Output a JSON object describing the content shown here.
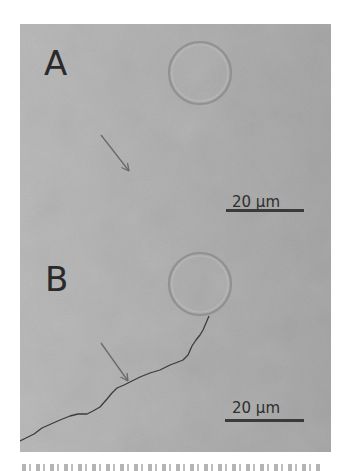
{
  "figure": {
    "panels": [
      {
        "label": "A",
        "scale_bar": {
          "text": "20 μm"
        },
        "features": [
          "circular-bubble",
          "arrow"
        ]
      },
      {
        "label": "B",
        "scale_bar": {
          "text": "20 μm"
        },
        "features": [
          "circular-bubble",
          "arrow",
          "crack-line"
        ]
      }
    ],
    "colors": {
      "background_gray": "#b0b0b0",
      "label_color": "#2a2a2a",
      "scale_bar_color": "#3a3a3a",
      "crack_color": "#3c3c3c",
      "arrow_color": "#6a6a6a",
      "bubble_outline": "#8c8c8c"
    }
  }
}
